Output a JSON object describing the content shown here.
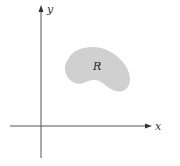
{
  "diagram": {
    "type": "coordinate-plane-region",
    "axes": {
      "x_label": "x",
      "y_label": "y",
      "color": "#555555"
    },
    "region": {
      "label": "R",
      "fill_color": "#d0d0d0"
    }
  }
}
